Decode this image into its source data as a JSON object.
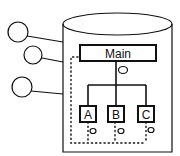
{
  "diagram": {
    "type": "container-hierarchy",
    "container": {
      "shape": "cylinder"
    },
    "main_node": {
      "label": "Main"
    },
    "child_nodes": [
      {
        "label": "A"
      },
      {
        "label": "B"
      },
      {
        "label": "C"
      }
    ],
    "external_ports": 3,
    "colors": {
      "stroke": "#111111",
      "background": "#ffffff"
    }
  }
}
